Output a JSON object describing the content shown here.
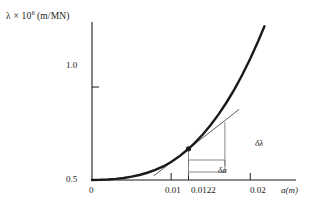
{
  "figure": {
    "background": "#ffffff",
    "line_color": "#1a1a1a",
    "thin_line_color": "#555555"
  },
  "axes": {
    "y_axis_title_prefix": "λ × 10",
    "y_axis_title_exponent": "6",
    "y_axis_title_units": "(m/MN)",
    "x_axis_title": "a(m)",
    "y_ticks": [
      "1.0",
      "0.5"
    ],
    "x_ticks": [
      "0",
      "0.01",
      "0.0122",
      "0.02"
    ]
  },
  "annotations": {
    "delta_lambda": "δλ",
    "delta_a": "δa"
  },
  "chart_data": {
    "type": "line",
    "title": "",
    "xlabel": "a(m)",
    "ylabel": "λ × 10⁶ (m/MN)",
    "xlim": [
      0,
      0.0225
    ],
    "ylim": [
      0.5,
      1.35
    ],
    "grid": false,
    "legend": null,
    "x_tick_values": [
      0,
      0.01,
      0.0122,
      0.02
    ],
    "x_tick_labels": [
      "0",
      "0.01",
      "0.0122",
      "0.02"
    ],
    "y_tick_values": [
      0.5,
      1.0
    ],
    "y_tick_labels": [
      "0.5",
      "1.0"
    ],
    "series": [
      {
        "name": "compliance curve",
        "style": "thick-solid",
        "x": [
          0.0,
          0.001,
          0.002,
          0.003,
          0.004,
          0.005,
          0.006,
          0.007,
          0.008,
          0.009,
          0.01,
          0.011,
          0.0122,
          0.013,
          0.014,
          0.015,
          0.016,
          0.017,
          0.018,
          0.019,
          0.02,
          0.021,
          0.0218
        ],
        "y": [
          0.5,
          0.501,
          0.503,
          0.506,
          0.511,
          0.518,
          0.527,
          0.539,
          0.554,
          0.573,
          0.597,
          0.626,
          0.668,
          0.7,
          0.745,
          0.796,
          0.853,
          0.917,
          0.988,
          1.066,
          1.152,
          1.246,
          1.327
        ]
      },
      {
        "name": "tangent at a = 0.0122",
        "style": "thin-solid",
        "x": [
          0.0078,
          0.0122,
          0.0186
        ],
        "y": [
          0.522,
          0.668,
          0.88
        ]
      }
    ],
    "marked_point": {
      "x": 0.0122,
      "y": 0.668,
      "label": "tangent point"
    },
    "slope_triangle": {
      "x_start": 0.0122,
      "x_end": 0.0168,
      "y_base": 0.5,
      "y_top": 0.812,
      "horizontal_label": "δa",
      "vertical_label": "δλ"
    }
  }
}
